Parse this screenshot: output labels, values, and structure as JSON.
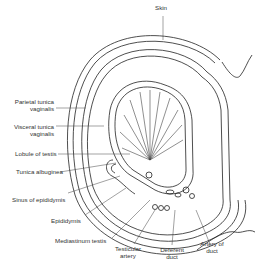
{
  "diagram": {
    "labels": {
      "skin": "Skin",
      "parietal_1": "Parietal tunica",
      "parietal_2": "vaginalis",
      "visceral_1": "Visceral tunica",
      "visceral_2": "vaginalis",
      "lobule": "Lobule of testis",
      "albuginea": "Tunica albuginea",
      "sinus": "Sinus of epididymis",
      "epididymis": "Epididymis",
      "mediastinum": "Mediastinum testis",
      "testicular_1": "Testicular",
      "testicular_2": "artery",
      "deferent_1": "Deferent",
      "deferent_2": "duct",
      "artery_duct_1": "Artery of",
      "artery_duct_2": "duct"
    },
    "colors": {
      "line": "#222222",
      "label": "#333333",
      "shade": "#bbbbbb"
    }
  }
}
